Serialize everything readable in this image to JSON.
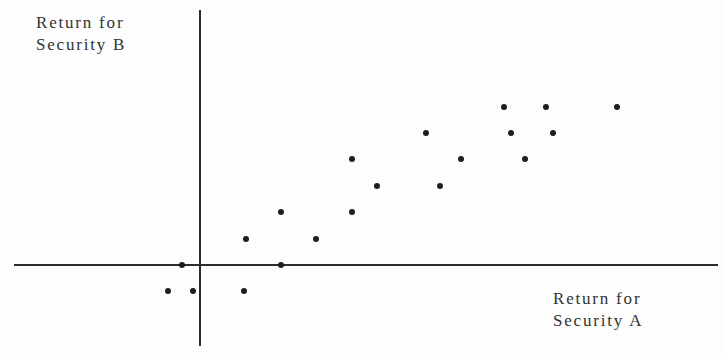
{
  "chart_data": {
    "type": "scatter",
    "title": "",
    "xlabel": "Return for Security A",
    "ylabel": "Return for Security B",
    "grid": false,
    "legend": null,
    "ticks": "none",
    "xlim": [
      -5.3,
      14.3
    ],
    "ylim": [
      -3.1,
      9.9
    ],
    "note": "Axes have no tick labels; values are in relative units with origin at axis intersection (x unit ≈ 35px, y unit ≈ 26.5px).",
    "points": [
      {
        "x": -0.9,
        "y": -1
      },
      {
        "x": -0.5,
        "y": 0
      },
      {
        "x": -0.2,
        "y": -1
      },
      {
        "x": 1.25,
        "y": -1
      },
      {
        "x": 1.3,
        "y": 1
      },
      {
        "x": 2.3,
        "y": 2
      },
      {
        "x": 2.3,
        "y": 0
      },
      {
        "x": 3.3,
        "y": 1
      },
      {
        "x": 4.3,
        "y": 2
      },
      {
        "x": 4.3,
        "y": 4
      },
      {
        "x": 5.0,
        "y": 3
      },
      {
        "x": 6.4,
        "y": 5
      },
      {
        "x": 6.8,
        "y": 3
      },
      {
        "x": 7.4,
        "y": 4
      },
      {
        "x": 8.6,
        "y": 6
      },
      {
        "x": 8.8,
        "y": 5
      },
      {
        "x": 9.2,
        "y": 4
      },
      {
        "x": 9.8,
        "y": 6
      },
      {
        "x": 10.0,
        "y": 5
      },
      {
        "x": 11.8,
        "y": 6
      }
    ]
  },
  "layout": {
    "origin_px": {
      "x": 200,
      "y": 265
    },
    "x_unit_px": 35.3,
    "y_unit_px": 26.4,
    "x_axis": {
      "x1": 14,
      "x2": 718,
      "y": 265
    },
    "y_axis": {
      "x": 200,
      "y1": 10,
      "y2": 346
    }
  },
  "labels": {
    "y_axis": {
      "line1": "Return for",
      "line2": "Security B"
    },
    "x_axis": {
      "line1": "Return for",
      "line2": "Security A"
    }
  },
  "colors": {
    "axis": "#2b2b2b",
    "point": "#1e1e1e",
    "text": "#333333",
    "background": "#fdfdfd"
  }
}
